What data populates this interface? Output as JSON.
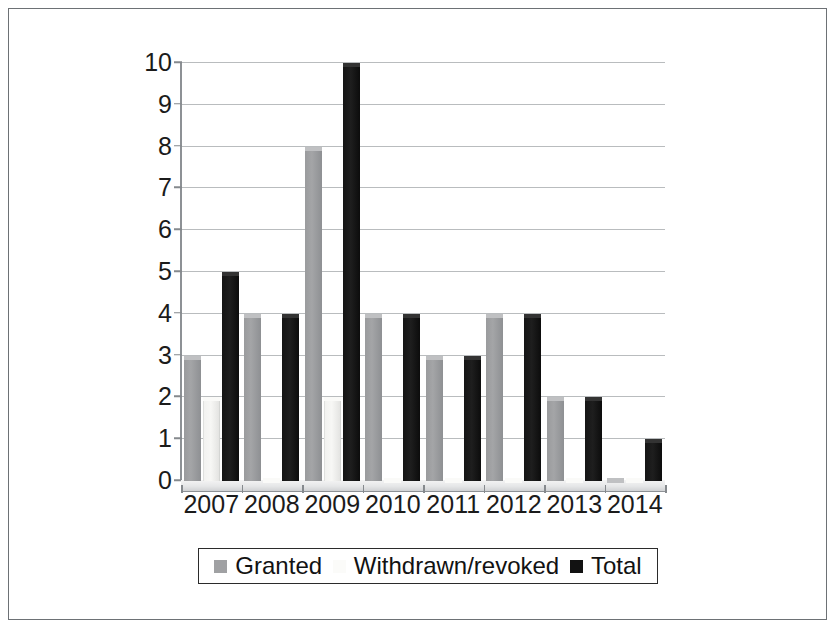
{
  "chart_data": {
    "type": "bar",
    "title": "",
    "subtitle": "",
    "xlabel": "",
    "ylabel": "",
    "categories": [
      "2007",
      "2008",
      "2009",
      "2010",
      "2011",
      "2012",
      "2013",
      "2014"
    ],
    "series": [
      {
        "name": "Granted",
        "color": "#a0a1a3",
        "values": [
          3,
          4,
          8,
          4,
          3,
          4,
          2,
          0
        ]
      },
      {
        "name": "Withdrawn/revoked",
        "color": "#fbfbf9",
        "values": [
          2,
          0,
          2,
          0,
          0,
          0,
          0,
          0
        ]
      },
      {
        "name": "Total",
        "color": "#121212",
        "values": [
          5,
          4,
          10,
          4,
          3,
          4,
          2,
          1
        ]
      }
    ],
    "ylim": [
      0,
      10
    ],
    "y_ticks": [
      "0",
      "1",
      "2",
      "3",
      "4",
      "5",
      "6",
      "7",
      "8",
      "9",
      "10"
    ],
    "grid": true,
    "legend_position": "bottom",
    "style": "3d-clustered-column"
  },
  "legend": {
    "items": [
      {
        "label": "Granted",
        "swatch": "granted-swatch"
      },
      {
        "label": "Withdrawn/revoked",
        "swatch": "withdrawn-swatch"
      },
      {
        "label": "Total",
        "swatch": "total-swatch"
      }
    ]
  }
}
